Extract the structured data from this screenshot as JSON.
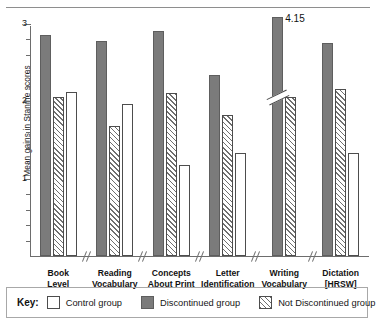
{
  "chart_data": {
    "type": "bar",
    "title": "",
    "subtitle": "",
    "xlabel": "",
    "ylabel": "Mean gains in Stanine scores",
    "ylim": [
      0,
      3
    ],
    "ytick_labels": [
      "1",
      "2",
      "3"
    ],
    "ytick_values": [
      1,
      2,
      3
    ],
    "minor_ticks": true,
    "grid": false,
    "axis_broken": true,
    "legend_position": "bottom",
    "categories": [
      "Book Level",
      "Reading Vocabulary",
      "Concepts About Print",
      "Letter Identification",
      "Writing Vocabulary",
      "Dictation [HRSW]"
    ],
    "category_lines": [
      [
        "Book",
        "Level"
      ],
      [
        "Reading",
        "Vocabulary"
      ],
      [
        "Concepts",
        "About Print"
      ],
      [
        "Letter",
        "Identification"
      ],
      [
        "Writing",
        "Vocabulary"
      ],
      [
        "Dictation",
        "[HRSW]"
      ]
    ],
    "series": [
      {
        "name": "Discontinued group",
        "key": "discontinued",
        "values": [
          2.85,
          2.78,
          2.9,
          2.33,
          4.15,
          2.75
        ]
      },
      {
        "name": "Not Discontinued group",
        "key": "notdiscontinued",
        "values": [
          2.05,
          1.68,
          2.1,
          1.82,
          2.05,
          2.15
        ]
      },
      {
        "name": "Control group",
        "key": "control",
        "values": [
          2.12,
          1.96,
          1.18,
          1.33,
          null,
          1.33
        ]
      }
    ],
    "annotations": [
      {
        "label": "4.15",
        "category": "Writing Vocabulary",
        "series": "Discontinued group",
        "note": "bar exceeds axis; drawn with break mark"
      }
    ]
  },
  "legend": {
    "title": "Key:",
    "items": [
      {
        "label": "Control group",
        "swatch": "control"
      },
      {
        "label": "Discontinued group",
        "swatch": "discontinued"
      },
      {
        "label": "Not Discontinued group",
        "swatch": "notdiscontinued"
      }
    ]
  },
  "colors": {
    "discontinued": "#7b7b7b",
    "control": "#ffffff",
    "hatch": "#6f6f6f",
    "axis": "#6d6d6d",
    "text": "#1a1a1a",
    "legend_border": "#a8a8a8"
  }
}
